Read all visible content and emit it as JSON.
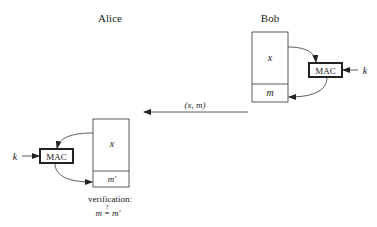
{
  "diagram": {
    "parties": {
      "alice": {
        "label": "Alice"
      },
      "bob": {
        "label": "Bob"
      }
    },
    "bob": {
      "message_field": "x",
      "tag_field": "m",
      "mac_label": "MAC",
      "key_label": "k"
    },
    "alice": {
      "message_field": "x",
      "tag_field": "m′",
      "mac_label": "MAC",
      "key_label": "k"
    },
    "transmission": {
      "label": "(x, m)"
    },
    "verification": {
      "label": "verification:",
      "formula_left": "m",
      "formula_op": "=",
      "formula_question": "?",
      "formula_right": "m′"
    },
    "colors": {
      "stroke": "#333333",
      "text": "#222222",
      "background": "#ffffff"
    }
  }
}
